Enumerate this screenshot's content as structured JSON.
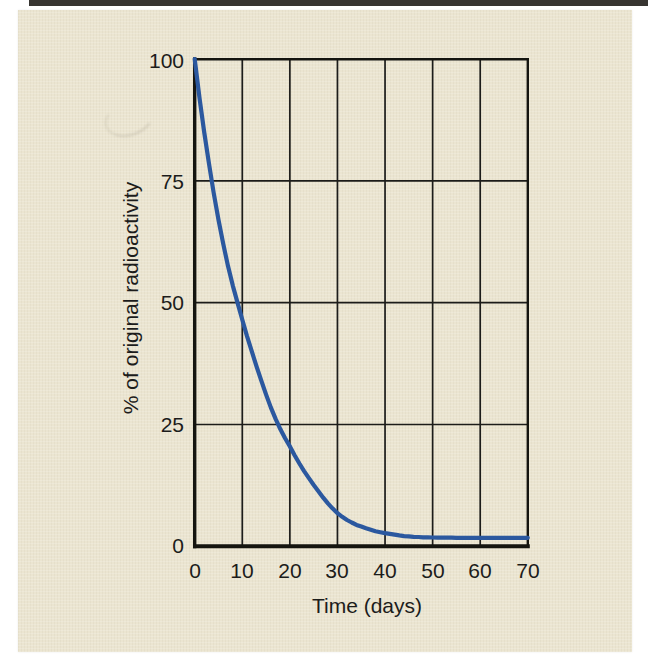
{
  "figure": {
    "page_background": "#ffffff",
    "panel_color": "#ebe5d1",
    "axis_color": "#1c1c1a",
    "text_color": "#1c1c1b"
  },
  "chart_data": {
    "type": "line",
    "title": "",
    "xlabel": "Time (days)",
    "ylabel": "% of original radioactivity",
    "xlim": [
      0,
      70
    ],
    "ylim": [
      0,
      100
    ],
    "xticks": [
      0,
      10,
      20,
      30,
      40,
      50,
      60,
      70
    ],
    "yticks": [
      100,
      75,
      50,
      25,
      0
    ],
    "xtick_labels": [
      "0",
      "10",
      "20",
      "30",
      "40",
      "50",
      "60",
      "70"
    ],
    "ytick_labels": [
      "100",
      "75",
      "50",
      "25",
      "0"
    ],
    "grid": true,
    "legend_position": "none",
    "line_color": "#2b589f",
    "series": [
      {
        "name": "% of original radioactivity",
        "x": [
          0,
          1,
          2,
          3,
          4,
          5,
          6,
          7,
          8,
          9,
          10,
          12,
          14,
          16,
          18,
          20,
          22,
          24,
          26,
          28,
          30,
          32,
          34,
          36,
          38,
          40,
          42,
          44,
          46,
          48,
          50,
          55,
          60,
          65,
          70
        ],
        "y": [
          100,
          92,
          85,
          78.5,
          72.5,
          67,
          62,
          57.5,
          53.5,
          50,
          46.5,
          40,
          34,
          28.5,
          24,
          20.5,
          17,
          14,
          11.3,
          8.8,
          6.8,
          5.4,
          4.4,
          3.7,
          3.1,
          2.7,
          2.4,
          2.1,
          1.95,
          1.85,
          1.8,
          1.75,
          1.75,
          1.75,
          1.75
        ]
      }
    ]
  }
}
